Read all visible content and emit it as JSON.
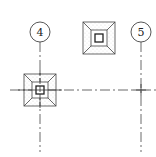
{
  "drawing": {
    "type": "structural foundation plan fragment",
    "line_color": "#333333",
    "background": "#ffffff",
    "grid_bubbles": [
      {
        "label": "4",
        "cx": 40,
        "cy": 32,
        "r": 10
      },
      {
        "label": "5",
        "cx": 141,
        "cy": 32,
        "r": 10
      }
    ],
    "grid_lines": {
      "vertical": [
        {
          "x": 40,
          "y1": 42,
          "y2": 152
        },
        {
          "x": 141,
          "y1": 42,
          "y2": 152
        }
      ],
      "horizontal": [
        {
          "y": 90,
          "x1": 10,
          "x2": 156
        }
      ]
    },
    "footings": [
      {
        "name": "footing-top",
        "cx": 99,
        "cy": 38,
        "outer": 32,
        "mid": 16,
        "inner": 8
      },
      {
        "name": "footing-grid-4",
        "cx": 40,
        "cy": 90,
        "outer": 32,
        "mid": 16,
        "inner": 8
      }
    ]
  }
}
